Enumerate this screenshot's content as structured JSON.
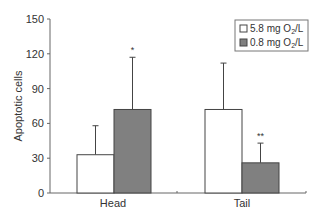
{
  "chart_data": {
    "type": "bar",
    "title": "",
    "xlabel": "",
    "ylabel": "Apoptotic cells",
    "ylim": [
      0,
      150
    ],
    "yticks": [
      0,
      30,
      60,
      90,
      120,
      150
    ],
    "grid": false,
    "legend_position": "upper right",
    "categories": [
      "Head",
      "Tail"
    ],
    "series": [
      {
        "name": "5.8 mg O2/L",
        "color": "#ffffff",
        "values": [
          33,
          72
        ],
        "error_upper": [
          58,
          112
        ]
      },
      {
        "name": "0.8 mg O2/L",
        "color": "#808080",
        "values": [
          72,
          26
        ],
        "error_upper": [
          117,
          43
        ]
      }
    ],
    "annotations": [
      {
        "category": "Head",
        "series": "0.8 mg O2/L",
        "text": "*"
      },
      {
        "category": "Tail",
        "series": "0.8 mg O2/L",
        "text": "**"
      }
    ]
  },
  "legend": {
    "items": [
      {
        "prefix": "5.8 mg O",
        "sub": "2",
        "suffix": "/L",
        "color": "#ffffff"
      },
      {
        "prefix": "0.8 mg O",
        "sub": "2",
        "suffix": "/L",
        "color": "#808080"
      }
    ]
  }
}
